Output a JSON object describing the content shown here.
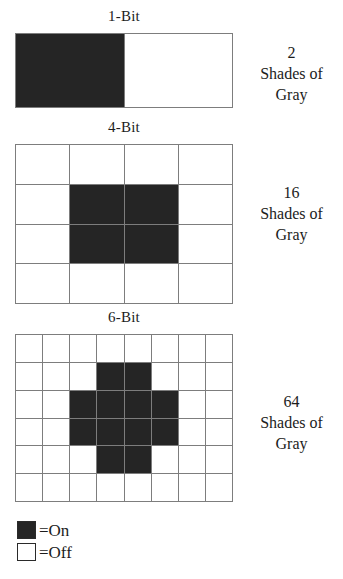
{
  "figure": {
    "background": "#ffffff",
    "on_color": "#252525",
    "off_color": "#ffffff",
    "grid_line_color": "#7d7d7d"
  },
  "sections": [
    {
      "id": "1bit",
      "title": "1-Bit",
      "grid": {
        "cols": 2,
        "rows": 1
      },
      "cells": [
        [
          1,
          0
        ]
      ],
      "shades": {
        "count": "2",
        "line2": "Shades of",
        "line3": "Gray"
      }
    },
    {
      "id": "4bit",
      "title": "4-Bit",
      "grid": {
        "cols": 4,
        "rows": 4
      },
      "cells": [
        [
          0,
          0,
          0,
          0
        ],
        [
          0,
          1,
          1,
          0
        ],
        [
          0,
          1,
          1,
          0
        ],
        [
          0,
          0,
          0,
          0
        ]
      ],
      "shades": {
        "count": "16",
        "line2": "Shades of",
        "line3": "Gray"
      }
    },
    {
      "id": "6bit",
      "title": "6-Bit",
      "grid": {
        "cols": 8,
        "rows": 6
      },
      "cells": [
        [
          0,
          0,
          0,
          0,
          0,
          0,
          0,
          0
        ],
        [
          0,
          0,
          0,
          1,
          1,
          0,
          0,
          0
        ],
        [
          0,
          0,
          1,
          1,
          1,
          1,
          0,
          0
        ],
        [
          0,
          0,
          1,
          1,
          1,
          1,
          0,
          0
        ],
        [
          0,
          0,
          0,
          1,
          1,
          0,
          0,
          0
        ],
        [
          0,
          0,
          0,
          0,
          0,
          0,
          0,
          0
        ]
      ],
      "shades": {
        "count": "64",
        "line2": "Shades of",
        "line3": "Gray"
      }
    }
  ],
  "legend": {
    "on_label": "=On",
    "off_label": "=Off"
  }
}
